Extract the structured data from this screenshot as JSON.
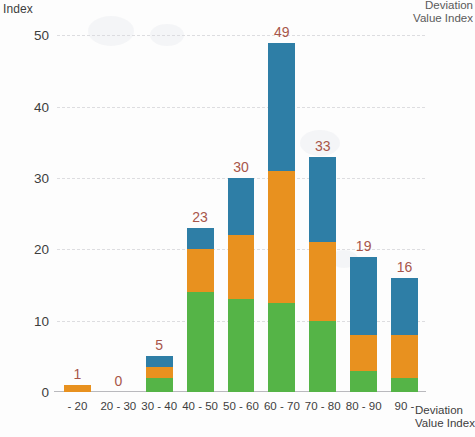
{
  "chart_data": {
    "type": "bar",
    "title": "",
    "subtitle": "",
    "xlabel": "Deviation Value Index",
    "ylabel": "Index",
    "corner_label": "Deviation Value Index",
    "categories": [
      "- 20",
      "20 - 30",
      "30 - 40",
      "40 - 50",
      "50 - 60",
      "60 - 70",
      "70 - 80",
      "80 - 90",
      "90 -"
    ],
    "totals": [
      1,
      0,
      5,
      23,
      30,
      49,
      33,
      19,
      16
    ],
    "stacked": true,
    "series": [
      {
        "name": "green",
        "color": "#55b447",
        "values": [
          0,
          0,
          2,
          14,
          13,
          12.5,
          10,
          3,
          2
        ]
      },
      {
        "name": "orange",
        "color": "#e8911f",
        "values": [
          1,
          0,
          1.5,
          6,
          9,
          18.5,
          11,
          5,
          6
        ]
      },
      {
        "name": "blue",
        "color": "#2e7ea6",
        "values": [
          0,
          0,
          1.5,
          3,
          8,
          18,
          12,
          11,
          8
        ]
      }
    ],
    "labels": [
      "1",
      "0",
      "5",
      "23",
      "30",
      "49",
      "33",
      "19",
      "16"
    ],
    "label_color": "#a8564a",
    "yticks": [
      0,
      10,
      20,
      30,
      40,
      50
    ],
    "ytick_labels": [
      "0",
      "10",
      "20",
      "30",
      "40",
      "50"
    ],
    "ylim": [
      0,
      53
    ],
    "grid": true,
    "grid_axis": "y",
    "legend": "none"
  }
}
